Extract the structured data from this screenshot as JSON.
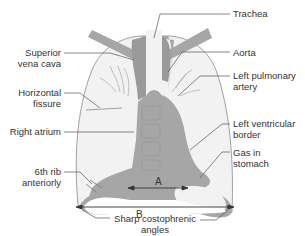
{
  "figure": {
    "colors": {
      "lung_fill": "#f2f2f2",
      "lung_outline": "#8a8a8a",
      "mediastinum": "#a6a6a6",
      "vessel": "#999999",
      "stomach_gas": "#f2f2f2",
      "leader_line": "#555555",
      "text": "#333333"
    }
  },
  "labels": {
    "trachea": "Trachea",
    "svc_line1": "Superior",
    "svc_line2": "vena cava",
    "aorta": "Aorta",
    "lpa_line1": "Left pulmonary",
    "lpa_line2": "artery",
    "hf_line1": "Horizontal",
    "hf_line2": "fissure",
    "right_atrium": "Right atrium",
    "lvb_line1": "Left ventricular",
    "lvb_line2": "border",
    "gas_line1": "Gas in",
    "gas_line2": "stomach",
    "rib_line1": "6th rib",
    "rib_line2": "anteriorly",
    "angles_line1": "Sharp costophrenic",
    "angles_line2": "angles"
  },
  "measurements": {
    "a": "A",
    "b": "B"
  }
}
